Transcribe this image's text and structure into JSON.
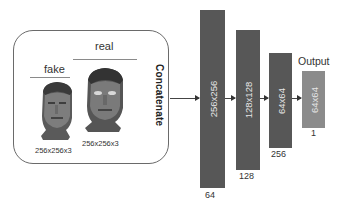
{
  "diagram": {
    "input_group": {
      "fake": {
        "label": "fake",
        "size": "256x256x3"
      },
      "real": {
        "label": "real",
        "size": "256x256x3"
      },
      "merge_label": "Concatenate"
    },
    "layers": [
      {
        "spatial": "256x256",
        "channels": "64"
      },
      {
        "spatial": "128x128",
        "channels": "128"
      },
      {
        "spatial": "64x64",
        "channels": "256"
      },
      {
        "spatial": "64x64",
        "channels": "1",
        "title": "Output"
      }
    ],
    "colors": {
      "layer_fill": "#575757",
      "output_fill": "#8b8b8b",
      "layer_text": "#e6e6e6",
      "border": "#6a6a6a"
    }
  }
}
